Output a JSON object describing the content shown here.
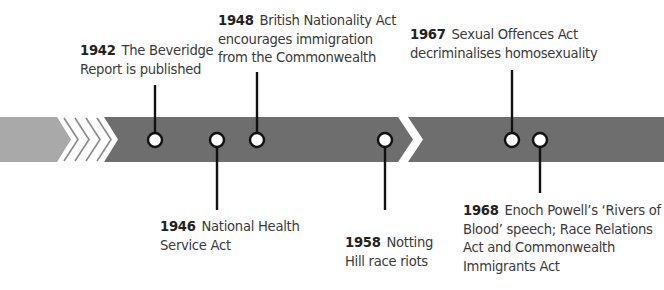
{
  "colors": {
    "band_light": "#a9a9a9",
    "band_dark": "#6e6e6e",
    "chevron_white": "#ffffff",
    "pin_stroke": "#111111",
    "pin_fill": "#ffffff",
    "text": "#3a3a3a"
  },
  "timeline": {
    "band": {
      "top": 117,
      "bottom": 162
    },
    "events": [
      {
        "year": "1942",
        "lines": [
          "The Beveridge",
          "Report is published"
        ],
        "position": "above",
        "pin_x": 155,
        "text_x": 80,
        "text_y": 42,
        "line_end_y": 85
      },
      {
        "year": "1946",
        "lines": [
          "National Health",
          "Service Act"
        ],
        "position": "below",
        "pin_x": 217,
        "text_x": 160,
        "text_y": 218,
        "line_end_y": 210
      },
      {
        "year": "1948",
        "lines": [
          "British Nationality Act",
          "encourages immigration",
          "from the Commonwealth"
        ],
        "position": "above",
        "pin_x": 257,
        "text_x": 218,
        "text_y": 12,
        "line_end_y": 72
      },
      {
        "year": "1958",
        "lines": [
          "Notting",
          "Hill race riots"
        ],
        "position": "below",
        "pin_x": 385,
        "text_x": 345,
        "text_y": 234,
        "line_end_y": 210
      },
      {
        "year": "1967",
        "lines": [
          "Sexual Offences Act",
          "decriminalises homosexuality"
        ],
        "position": "above",
        "pin_x": 512,
        "text_x": 410,
        "text_y": 26,
        "line_end_y": 70
      },
      {
        "year": "1968",
        "lines": [
          "Enoch Powell’s ‘Rivers of",
          "Blood’ speech; Race Relations",
          "Act and Commonwealth",
          "Immigrants Act"
        ],
        "position": "below",
        "pin_x": 540,
        "text_x": 463,
        "text_y": 202,
        "line_end_y": 193
      }
    ]
  }
}
